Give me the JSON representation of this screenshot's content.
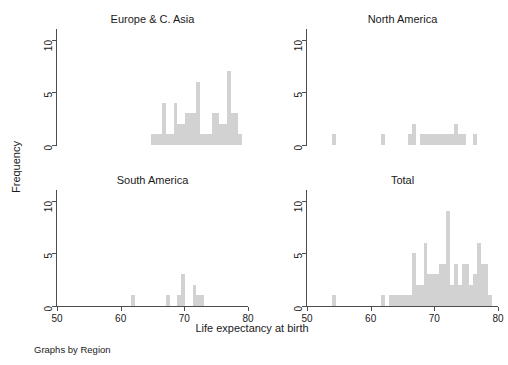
{
  "figure": {
    "xlabel": "Life expectancy at birth",
    "ylabel": "Frequency",
    "note": "Graphs by Region",
    "bar_color": "#d2d2d2",
    "axis_color": "#4d4d4d",
    "background": "#ffffff"
  },
  "axes": {
    "x_ticks": [
      "50",
      "60",
      "70",
      "80"
    ],
    "y_ticks": [
      "0",
      "5",
      "10"
    ],
    "xlim": [
      50,
      80
    ],
    "ylim": [
      0,
      11
    ]
  },
  "panels": [
    {
      "title": "Europe & C. Asia"
    },
    {
      "title": "North America"
    },
    {
      "title": "South America"
    },
    {
      "title": "Total"
    }
  ],
  "chart_data": {
    "type": "bar",
    "title": "",
    "subtitle": "",
    "xlabel": "Life expectancy at birth",
    "ylabel": "Frequency",
    "note": "Graphs by Region",
    "grid": false,
    "legend": "none",
    "layout": "2x2 small multiples (faceted histogram)",
    "xlim": [
      50,
      80
    ],
    "ylim": [
      0,
      11
    ],
    "xticks": [
      50,
      60,
      70,
      80
    ],
    "yticks": [
      0,
      5,
      10
    ],
    "bin_width": 0.6,
    "panels": [
      {
        "name": "Europe & C. Asia",
        "bins": [
          {
            "x": 65.0,
            "y": 1
          },
          {
            "x": 65.6,
            "y": 1
          },
          {
            "x": 66.2,
            "y": 1
          },
          {
            "x": 66.8,
            "y": 4
          },
          {
            "x": 67.4,
            "y": 1
          },
          {
            "x": 68.0,
            "y": 1
          },
          {
            "x": 68.6,
            "y": 4
          },
          {
            "x": 69.2,
            "y": 2
          },
          {
            "x": 69.8,
            "y": 2
          },
          {
            "x": 70.4,
            "y": 3
          },
          {
            "x": 71.0,
            "y": 3
          },
          {
            "x": 71.6,
            "y": 3
          },
          {
            "x": 72.2,
            "y": 6
          },
          {
            "x": 72.8,
            "y": 1
          },
          {
            "x": 73.4,
            "y": 1
          },
          {
            "x": 74.0,
            "y": 1
          },
          {
            "x": 74.6,
            "y": 3
          },
          {
            "x": 75.2,
            "y": 3
          },
          {
            "x": 75.8,
            "y": 2
          },
          {
            "x": 76.4,
            "y": 2
          },
          {
            "x": 77.0,
            "y": 7
          },
          {
            "x": 77.6,
            "y": 3
          },
          {
            "x": 78.2,
            "y": 3
          },
          {
            "x": 78.8,
            "y": 1
          }
        ]
      },
      {
        "name": "North America",
        "bins": [
          {
            "x": 54.2,
            "y": 1
          },
          {
            "x": 62.0,
            "y": 1
          },
          {
            "x": 66.2,
            "y": 1
          },
          {
            "x": 66.8,
            "y": 2
          },
          {
            "x": 68.0,
            "y": 1
          },
          {
            "x": 68.6,
            "y": 1
          },
          {
            "x": 69.2,
            "y": 1
          },
          {
            "x": 69.8,
            "y": 1
          },
          {
            "x": 70.4,
            "y": 1
          },
          {
            "x": 71.0,
            "y": 1
          },
          {
            "x": 71.6,
            "y": 1
          },
          {
            "x": 72.2,
            "y": 1
          },
          {
            "x": 72.8,
            "y": 1
          },
          {
            "x": 73.4,
            "y": 2
          },
          {
            "x": 74.0,
            "y": 1
          },
          {
            "x": 74.6,
            "y": 1
          },
          {
            "x": 76.4,
            "y": 1
          }
        ]
      },
      {
        "name": "South America",
        "bins": [
          {
            "x": 62.0,
            "y": 1
          },
          {
            "x": 67.4,
            "y": 1
          },
          {
            "x": 69.2,
            "y": 1
          },
          {
            "x": 69.8,
            "y": 3
          },
          {
            "x": 71.6,
            "y": 2
          },
          {
            "x": 72.2,
            "y": 1
          },
          {
            "x": 72.8,
            "y": 1
          }
        ]
      },
      {
        "name": "Total",
        "bins": [
          {
            "x": 54.2,
            "y": 1
          },
          {
            "x": 62.0,
            "y": 1
          },
          {
            "x": 63.2,
            "y": 1
          },
          {
            "x": 63.8,
            "y": 1
          },
          {
            "x": 64.4,
            "y": 1
          },
          {
            "x": 65.0,
            "y": 1
          },
          {
            "x": 65.6,
            "y": 1
          },
          {
            "x": 66.2,
            "y": 1
          },
          {
            "x": 66.8,
            "y": 5
          },
          {
            "x": 67.4,
            "y": 2
          },
          {
            "x": 68.0,
            "y": 2
          },
          {
            "x": 68.6,
            "y": 6
          },
          {
            "x": 69.2,
            "y": 3
          },
          {
            "x": 69.8,
            "y": 3
          },
          {
            "x": 70.4,
            "y": 3
          },
          {
            "x": 71.0,
            "y": 4
          },
          {
            "x": 71.6,
            "y": 4
          },
          {
            "x": 72.2,
            "y": 9
          },
          {
            "x": 72.8,
            "y": 2
          },
          {
            "x": 73.4,
            "y": 4
          },
          {
            "x": 74.0,
            "y": 2
          },
          {
            "x": 74.6,
            "y": 4
          },
          {
            "x": 75.2,
            "y": 4
          },
          {
            "x": 75.8,
            "y": 2
          },
          {
            "x": 76.4,
            "y": 3
          },
          {
            "x": 77.0,
            "y": 6
          },
          {
            "x": 77.6,
            "y": 4
          },
          {
            "x": 78.2,
            "y": 4
          },
          {
            "x": 78.8,
            "y": 1
          }
        ]
      }
    ]
  }
}
